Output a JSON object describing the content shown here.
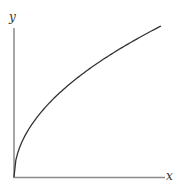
{
  "chart_data": {
    "type": "line",
    "title": "",
    "xlabel": "x",
    "ylabel": "y",
    "grid": false,
    "legend": null,
    "series": [
      {
        "name": "y = sqrt(x)",
        "x": [
          0,
          0.01,
          0.05,
          0.1,
          0.2,
          0.3,
          0.4,
          0.5,
          0.6,
          0.7,
          0.8,
          0.9,
          1.0
        ],
        "values": [
          0,
          0.1,
          0.224,
          0.316,
          0.447,
          0.548,
          0.632,
          0.707,
          0.775,
          0.837,
          0.894,
          0.949,
          1.0
        ]
      }
    ],
    "xlim": [
      0,
      1.0
    ],
    "ylim": [
      0,
      1.0
    ]
  },
  "labels": {
    "x_axis": "x",
    "y_axis": "y"
  },
  "colors": {
    "axis": "#8a8a8a",
    "curve": "#333333"
  }
}
